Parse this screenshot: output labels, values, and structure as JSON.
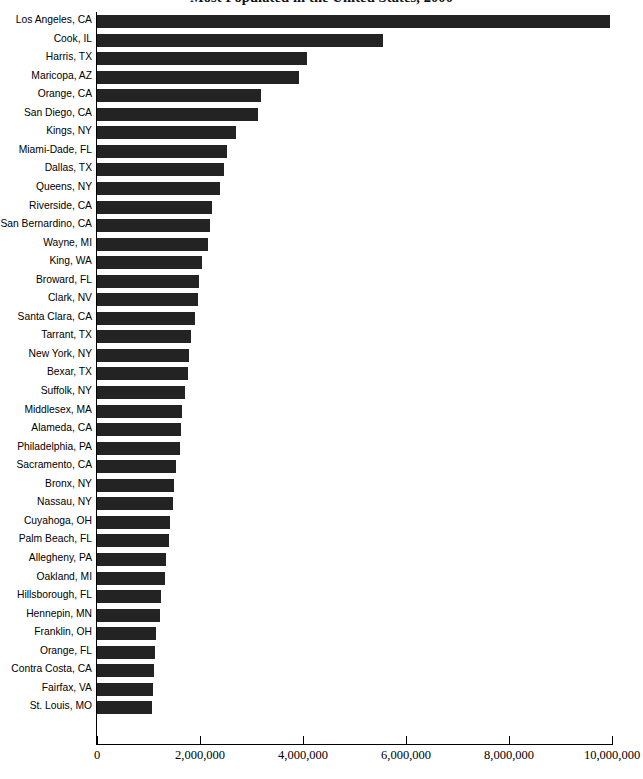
{
  "chart_data": {
    "type": "bar",
    "orientation": "horizontal",
    "title": "Most Populated in the United States, 2000",
    "xlabel": "",
    "ylabel": "",
    "xlim": [
      0,
      10000000
    ],
    "grid": false,
    "legend": null,
    "xticks": [
      {
        "value": 0,
        "label": "0"
      },
      {
        "value": 2000000,
        "label": "2,000,000"
      },
      {
        "value": 4000000,
        "label": "4,000,000"
      },
      {
        "value": 6000000,
        "label": "6,000,000"
      },
      {
        "value": 8000000,
        "label": "8,000,000"
      },
      {
        "value": 10000000,
        "label": "10,000,000"
      }
    ],
    "bar_color": "#232323",
    "categories": [
      "Los Angeles, CA",
      "Cook, IL",
      "Harris, TX",
      "Maricopa, AZ",
      "Orange, CA",
      "San Diego, CA",
      "Kings, NY",
      "Miami-Dade, FL",
      "Dallas, TX",
      "Queens, NY",
      "Riverside, CA",
      "San Bernardino, CA",
      "Wayne, MI",
      "King, WA",
      "Broward, FL",
      "Clark, NV",
      "Santa Clara, CA",
      "Tarrant, TX",
      "New York, NY",
      "Bexar, TX",
      "Suffolk, NY",
      "Middlesex, MA",
      "Alameda, CA",
      "Philadelphia, PA",
      "Sacramento, CA",
      "Bronx, NY",
      "Nassau, NY",
      "Cuyahoga, OH",
      "Palm Beach, FL",
      "Allegheny, PA",
      "Oakland, MI",
      "Hillsborough, FL",
      "Hennepin, MN",
      "Franklin, OH",
      "Orange, FL",
      "Contra Costa, CA",
      "Fairfax, VA",
      "St. Louis, MO"
    ],
    "values": [
      9960000,
      5550000,
      4080000,
      3930000,
      3180000,
      3120000,
      2700000,
      2520000,
      2460000,
      2380000,
      2240000,
      2190000,
      2160000,
      2030000,
      1990000,
      1960000,
      1900000,
      1830000,
      1780000,
      1760000,
      1710000,
      1650000,
      1640000,
      1620000,
      1530000,
      1500000,
      1470000,
      1420000,
      1390000,
      1340000,
      1320000,
      1240000,
      1220000,
      1150000,
      1130000,
      1100000,
      1080000,
      1070000
    ]
  }
}
